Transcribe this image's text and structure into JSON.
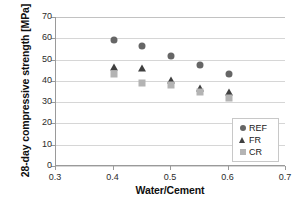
{
  "chart_data": {
    "type": "scatter",
    "title": "",
    "xlabel": "Water/Cement",
    "ylabel": "28-day compressive strength [MPa]",
    "xlim": [
      0.3,
      0.7
    ],
    "ylim": [
      0,
      70
    ],
    "xticks": [
      "0.3",
      "0.4",
      "0.5",
      "0.6",
      "0.7"
    ],
    "xtick_values": [
      0.3,
      0.4,
      0.5,
      0.6,
      0.7
    ],
    "yticks": [
      "0",
      "10",
      "20",
      "30",
      "40",
      "50",
      "60",
      "70"
    ],
    "ytick_values": [
      0,
      10,
      20,
      30,
      40,
      50,
      60,
      70
    ],
    "grid": "horizontal",
    "legend_position": "bottom-right",
    "x": [
      0.4,
      0.45,
      0.5,
      0.55,
      0.6
    ],
    "series": [
      {
        "name": "REF",
        "marker": "circle",
        "color": "#666666",
        "values": [
          59.2,
          56.6,
          51.7,
          47.3,
          43.4
        ]
      },
      {
        "name": "FR",
        "marker": "triangle",
        "color": "#404040",
        "values": [
          46.5,
          46.2,
          40.3,
          36.7,
          35.0
        ]
      },
      {
        "name": "CR",
        "marker": "square",
        "color": "#b4b4b4",
        "values": [
          43.2,
          39.1,
          38.0,
          34.6,
          31.8
        ]
      }
    ]
  },
  "legend": {
    "items": [
      {
        "label": "REF",
        "marker": "circle"
      },
      {
        "label": "FR",
        "marker": "triangle"
      },
      {
        "label": "CR",
        "marker": "square"
      }
    ]
  }
}
